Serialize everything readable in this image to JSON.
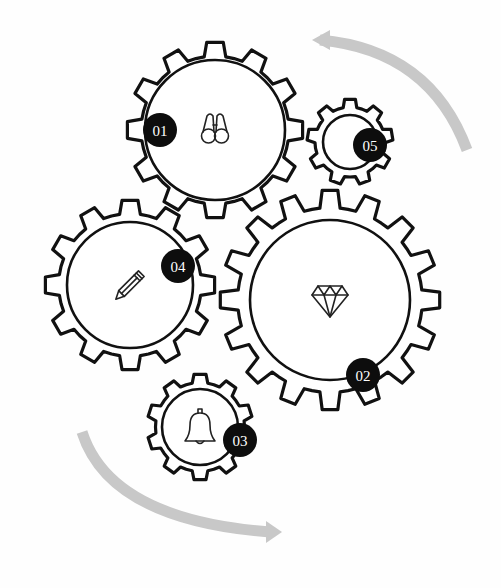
{
  "diagram": {
    "type": "interlocking-gears-process",
    "colors": {
      "outline": "#111111",
      "badge": "#0d0d0d",
      "badge_text": "#ffffff",
      "arrow": "#c8c8c8",
      "background": "#fefefe"
    },
    "gears": [
      {
        "id": "01",
        "label": "01",
        "icon": "binoculars-icon",
        "cx": 215,
        "cy": 130,
        "outer_r": 88,
        "inner_r": 70,
        "teeth": 12,
        "badge_x": 160,
        "badge_y": 130
      },
      {
        "id": "02",
        "label": "02",
        "icon": "diamond-icon",
        "cx": 330,
        "cy": 300,
        "outer_r": 110,
        "inner_r": 80,
        "teeth": 16,
        "badge_x": 363,
        "badge_y": 375
      },
      {
        "id": "03",
        "label": "03",
        "icon": "bell-icon",
        "cx": 200,
        "cy": 427,
        "outer_r": 53,
        "inner_r": 38,
        "teeth": 10,
        "badge_x": 240,
        "badge_y": 440
      },
      {
        "id": "04",
        "label": "04",
        "icon": "pencil-icon",
        "cx": 130,
        "cy": 285,
        "outer_r": 85,
        "inner_r": 63,
        "teeth": 12,
        "badge_x": 178,
        "badge_y": 266
      },
      {
        "id": "05",
        "label": "05",
        "icon": "none",
        "cx": 350,
        "cy": 142,
        "outer_r": 43,
        "inner_r": 27,
        "teeth": 9,
        "badge_x": 370,
        "badge_y": 145
      }
    ],
    "arrows": [
      {
        "name": "top-right-arrow",
        "direction": "counter-clockwise",
        "path": "M 467 150 Q 430 50 320 40"
      },
      {
        "name": "bottom-left-arrow",
        "direction": "counter-clockwise",
        "path": "M 82 432 Q 110 520 270 532"
      }
    ]
  }
}
